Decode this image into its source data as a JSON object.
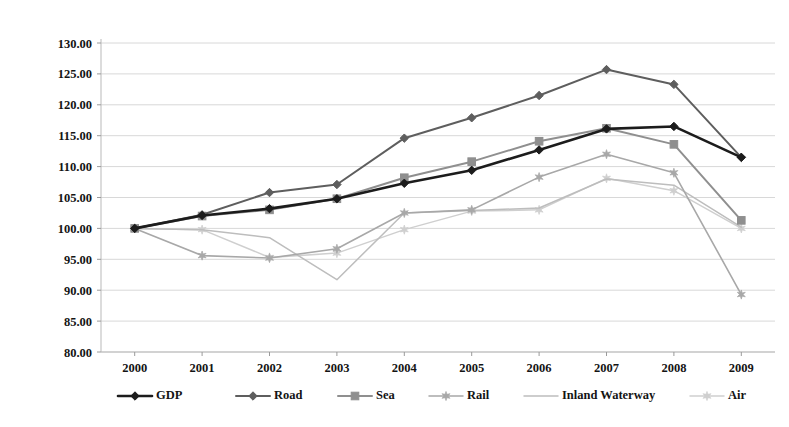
{
  "chart_data": {
    "type": "line",
    "title": "",
    "subtitle": "",
    "xlabel": "",
    "ylabel": "",
    "categories": [
      "2000",
      "2001",
      "2002",
      "2003",
      "2004",
      "2005",
      "2006",
      "2007",
      "2008",
      "2009"
    ],
    "x": [
      2000,
      2001,
      2002,
      2003,
      2004,
      2005,
      2006,
      2007,
      2008,
      2009
    ],
    "ylim": [
      80.0,
      130.0
    ],
    "ytick_labels": [
      "130.00",
      "125.00",
      "120.00",
      "115.00",
      "110.00",
      "105.00",
      "100.00",
      "95.00",
      "90.00",
      "85.00",
      "80.00"
    ],
    "ytick_values": [
      130,
      125,
      120,
      115,
      110,
      105,
      100,
      95,
      90,
      85,
      80
    ],
    "grid": true,
    "legend_position": "bottom",
    "series": [
      {
        "name": "GDP",
        "color": "#1c1c1c",
        "marker": "diamond",
        "width": 2.6,
        "values": [
          100.0,
          102.1,
          103.2,
          104.8,
          107.3,
          109.4,
          112.7,
          116.1,
          116.5,
          111.5
        ]
      },
      {
        "name": "Road",
        "color": "#5e5e5e",
        "marker": "diamond",
        "width": 2.0,
        "values": [
          100.0,
          102.2,
          105.8,
          107.1,
          114.6,
          117.9,
          121.5,
          125.7,
          123.3,
          111.5
        ]
      },
      {
        "name": "Sea",
        "color": "#8f8f8f",
        "marker": "square",
        "width": 2.0,
        "values": [
          100.0,
          102.0,
          103.0,
          104.8,
          108.2,
          110.8,
          114.1,
          116.2,
          113.6,
          101.3
        ]
      },
      {
        "name": "Rail",
        "color": "#a8a8a8",
        "marker": "star",
        "width": 1.6,
        "values": [
          100.0,
          95.6,
          95.2,
          96.7,
          102.5,
          103.0,
          108.3,
          112.0,
          109.0,
          89.3
        ]
      },
      {
        "name": "Inland Waterway",
        "color": "#bdbdbd",
        "marker": "none",
        "width": 1.5,
        "values": [
          100.0,
          99.8,
          98.5,
          91.7,
          102.5,
          102.9,
          103.3,
          108.0,
          107.0,
          100.2
        ]
      },
      {
        "name": "Air",
        "color": "#cfcfcf",
        "marker": "star",
        "width": 1.5,
        "values": [
          100.0,
          99.8,
          95.3,
          96.0,
          99.8,
          102.8,
          103.0,
          108.1,
          106.1,
          100.0
        ]
      }
    ],
    "legend": [
      {
        "label": "GDP",
        "color": "#1c1c1c",
        "marker": "diamond"
      },
      {
        "label": "Road",
        "color": "#5e5e5e",
        "marker": "diamond"
      },
      {
        "label": "Sea",
        "color": "#8f8f8f",
        "marker": "square"
      },
      {
        "label": "Rail",
        "color": "#a8a8a8",
        "marker": "star"
      },
      {
        "label": "Inland Waterway",
        "color": "#bdbdbd",
        "marker": "none"
      },
      {
        "label": "Air",
        "color": "#cfcfcf",
        "marker": "star"
      }
    ]
  }
}
